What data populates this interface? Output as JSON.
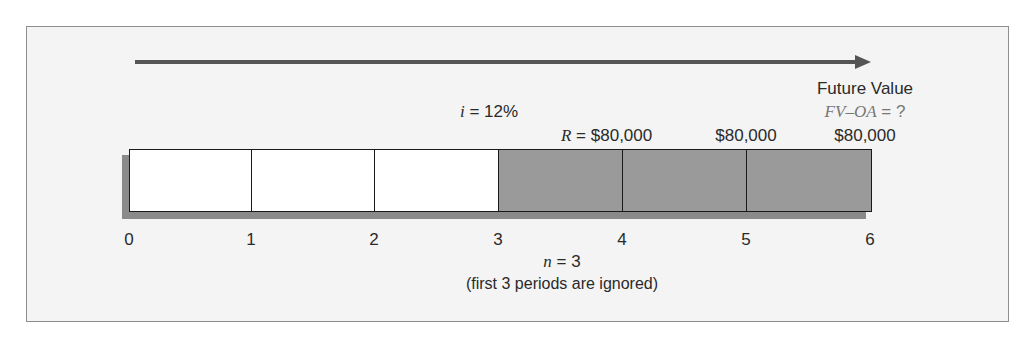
{
  "diagram": {
    "rate": {
      "var": "i",
      "eq": " = 12%"
    },
    "payment_first": {
      "var": "R",
      "eq": " = $80,000"
    },
    "payments": [
      "$80,000",
      "$80,000"
    ],
    "future_value": {
      "title": "Future Value",
      "formula": "FV–OA",
      "eq": " = ?"
    },
    "periods": [
      "0",
      "1",
      "2",
      "3",
      "4",
      "5",
      "6"
    ],
    "n": {
      "var": "n",
      "eq": " = 3"
    },
    "note": "(first 3 periods are ignored)",
    "colors": {
      "ignored_period": "#ffffff",
      "annuity_period": "#9a9a9a",
      "frame_bg": "#f4f4f4",
      "arrow": "#555555"
    }
  }
}
